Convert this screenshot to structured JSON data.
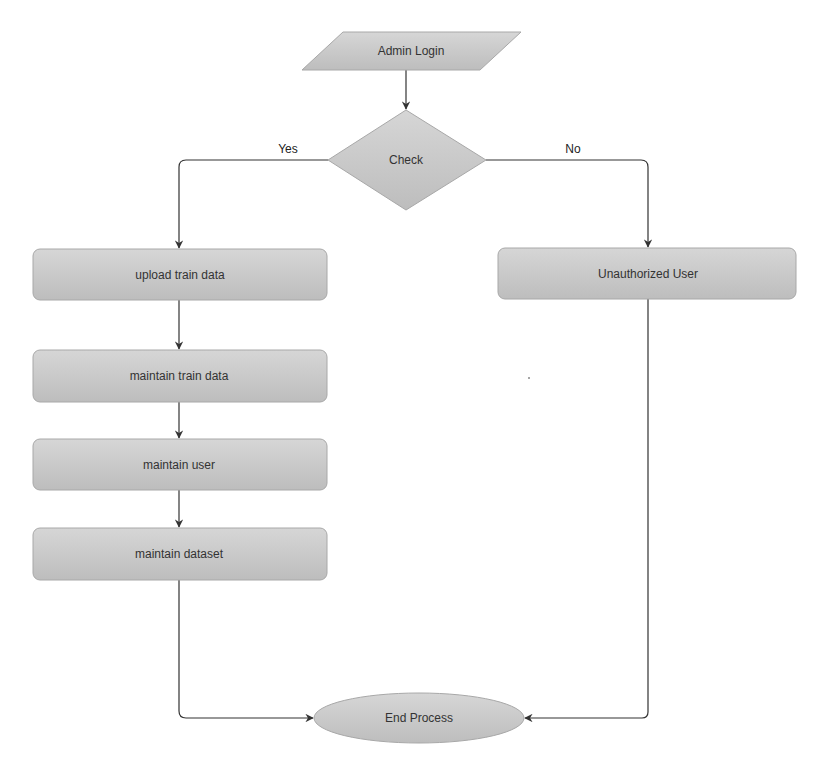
{
  "diagram": {
    "type": "flowchart",
    "colors": {
      "node_fill": "#c8c8c8",
      "node_fill_light": "#d9d9d9",
      "node_stroke": "#a8a8a8",
      "edge": "#333333",
      "text": "#333333"
    },
    "nodes": {
      "admin_login": {
        "label": "Admin Login",
        "shape": "parallelogram"
      },
      "check": {
        "label": "Check",
        "shape": "diamond"
      },
      "upload_train_data": {
        "label": "upload train data",
        "shape": "rounded-rect"
      },
      "unauthorized_user": {
        "label": "Unauthorized User",
        "shape": "rounded-rect"
      },
      "maintain_train_data": {
        "label": "maintain train data",
        "shape": "rounded-rect"
      },
      "maintain_user": {
        "label": "maintain user",
        "shape": "rounded-rect"
      },
      "maintain_dataset": {
        "label": "maintain dataset",
        "shape": "rounded-rect"
      },
      "end_process": {
        "label": "End Process",
        "shape": "ellipse"
      }
    },
    "edges": {
      "yes": {
        "from": "check",
        "to": "upload_train_data",
        "label": "Yes"
      },
      "no": {
        "from": "check",
        "to": "unauthorized_user",
        "label": "No"
      }
    },
    "flow": [
      "admin_login -> check",
      "check -(Yes)-> upload_train_data",
      "check -(No)-> unauthorized_user",
      "upload_train_data -> maintain_train_data",
      "maintain_train_data -> maintain_user",
      "maintain_user -> maintain_dataset",
      "maintain_dataset -> end_process",
      "unauthorized_user -> end_process"
    ]
  }
}
